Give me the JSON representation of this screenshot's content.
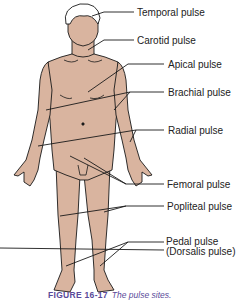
{
  "figure": {
    "caption_number": "FIGURE 16-17",
    "caption_text": "The pulse sites.",
    "skin_color": "#d9b49f",
    "outline_color": "#1a1a1a",
    "caption_color": "#5a4a9a"
  },
  "labels": [
    {
      "id": "temporal",
      "text": "Temporal pulse"
    },
    {
      "id": "carotid",
      "text": "Carotid pulse"
    },
    {
      "id": "apical",
      "text": "Apical pulse"
    },
    {
      "id": "brachial",
      "text": "Brachial pulse"
    },
    {
      "id": "radial",
      "text": "Radial pulse"
    },
    {
      "id": "femoral",
      "text": "Femoral pulse"
    },
    {
      "id": "popliteal",
      "text": "Popliteal pulse"
    },
    {
      "id": "pedal",
      "text": "Pedal pulse"
    },
    {
      "id": "dorsalis",
      "text": "(Dorsalis pulse)"
    }
  ]
}
